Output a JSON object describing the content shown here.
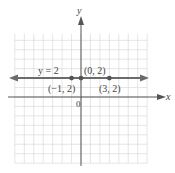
{
  "chart_data": {
    "type": "line",
    "title": "",
    "xlabel": "x",
    "ylabel": "y",
    "origin_label": "0",
    "equation_label": "y = 2",
    "xlim": [
      -7,
      7
    ],
    "ylim": [
      -7,
      7
    ],
    "grid": true,
    "series": [
      {
        "name": "y = 2",
        "kind": "horizontal line",
        "y": 2,
        "color": "#6b6b6b",
        "points": [
          {
            "x": -1,
            "y": 2,
            "label": "(−1, 2)"
          },
          {
            "x": 0,
            "y": 2,
            "label": "(0, 2)"
          },
          {
            "x": 3,
            "y": 2,
            "label": "(3, 2)"
          }
        ]
      }
    ]
  },
  "labels": {
    "x_axis": "x",
    "y_axis": "y",
    "origin": "0",
    "equation": "y = 2",
    "p1": "(−1, 2)",
    "p2": "(0, 2)",
    "p3": "(3, 2)"
  }
}
